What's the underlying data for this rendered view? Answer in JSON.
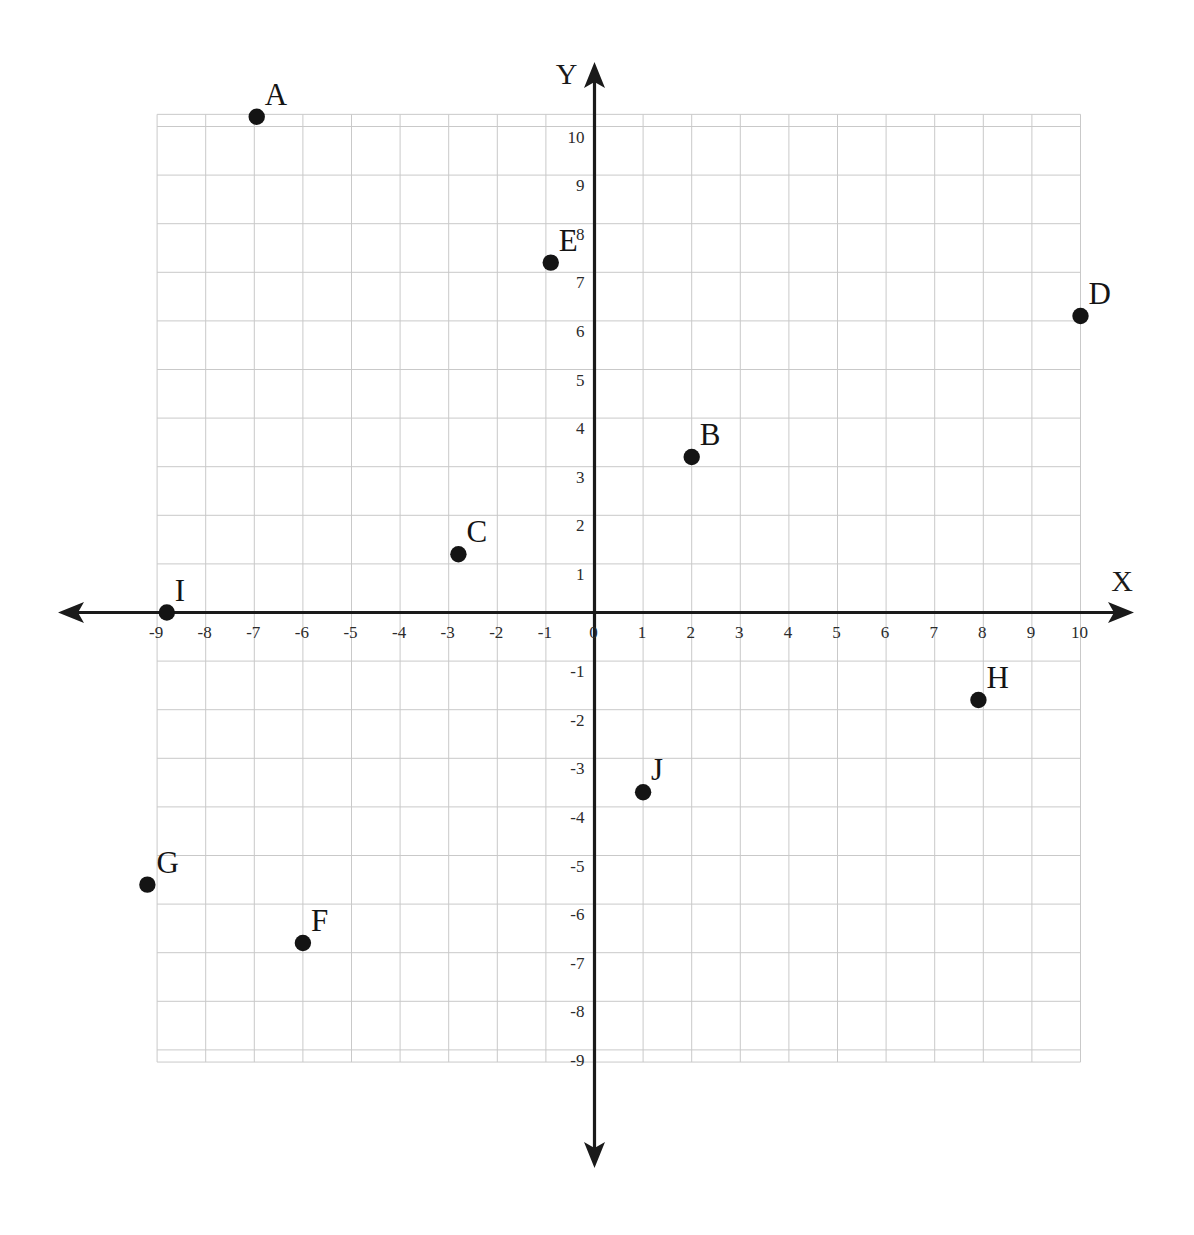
{
  "chart_data": {
    "type": "scatter",
    "title": "",
    "xlabel": "X",
    "ylabel": "Y",
    "xlim": [
      -9.35,
      10.35
    ],
    "ylim": [
      -9.35,
      10.45
    ],
    "grid": true,
    "legend": "none",
    "x_ticks": [
      -9,
      -8,
      -7,
      -6,
      -5,
      -4,
      -3,
      -2,
      -1,
      0,
      1,
      2,
      3,
      4,
      5,
      6,
      7,
      8,
      9,
      10
    ],
    "y_ticks": [
      -9,
      -8,
      -7,
      -6,
      -5,
      -4,
      -3,
      -2,
      -1,
      1,
      2,
      3,
      4,
      5,
      6,
      7,
      8,
      9,
      10
    ],
    "x_tick_labels": [
      "-9",
      "-8",
      "-7",
      "-6",
      "-5",
      "-4",
      "-3",
      "-2",
      "-1",
      "0",
      "1",
      "2",
      "3",
      "4",
      "5",
      "6",
      "7",
      "8",
      "9",
      "10"
    ],
    "y_tick_labels": [
      "-9",
      "-8",
      "-7",
      "-6",
      "-5",
      "-4",
      "-3",
      "-2",
      "-1",
      "1",
      "2",
      "3",
      "4",
      "5",
      "6",
      "7",
      "8",
      "9",
      "10"
    ],
    "origin_label": "0",
    "points": [
      {
        "label": "A",
        "x": -6.95,
        "y": 10.2
      },
      {
        "label": "B",
        "x": 2.0,
        "y": 3.2
      },
      {
        "label": "C",
        "x": -2.8,
        "y": 1.2
      },
      {
        "label": "D",
        "x": 10.0,
        "y": 6.1
      },
      {
        "label": "E",
        "x": -0.9,
        "y": 7.2
      },
      {
        "label": "F",
        "x": -6.0,
        "y": -6.8
      },
      {
        "label": "G",
        "x": -9.2,
        "y": -5.6
      },
      {
        "label": "H",
        "x": 7.9,
        "y": -1.8
      },
      {
        "label": "I",
        "x": -8.8,
        "y": 0.0
      },
      {
        "label": "J",
        "x": 1.0,
        "y": -3.7
      }
    ]
  },
  "colors": {
    "grid": "#c9c9c9",
    "axis": "#1a1a1a",
    "point": "#141414",
    "tick_text": "#2b2b2b",
    "background": "#ffffff"
  }
}
